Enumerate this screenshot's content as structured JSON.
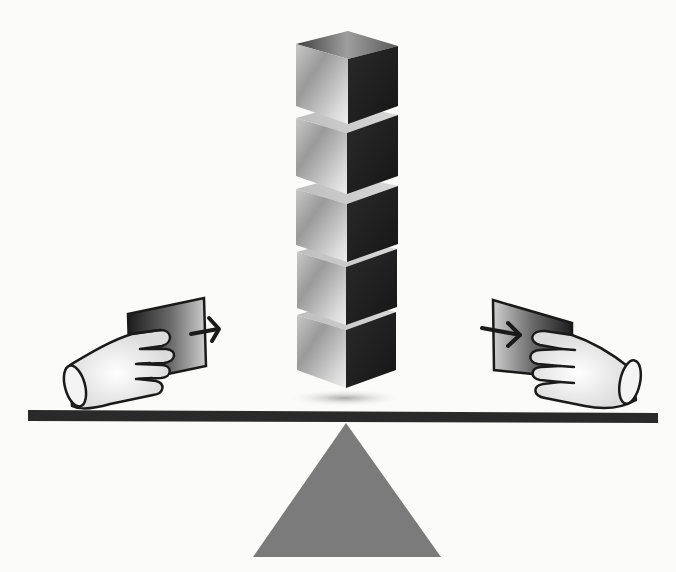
{
  "figure": {
    "title": "Balance scale with stacked cubes and hands exchanging cards",
    "cubes": {
      "count": 5,
      "colors": {
        "light": "#e6e6e6",
        "mid": "#8c8c8c",
        "dark": "#1e1e1e"
      }
    },
    "beam": {
      "color": "#2a2a2a"
    },
    "fulcrum": {
      "shape": "triangle",
      "color": "#7b7b7b"
    },
    "left_hand": {
      "action": "pushing card",
      "arrow_direction": "right"
    },
    "right_hand": {
      "action": "receiving card",
      "arrow_direction": "right"
    },
    "background_color": "#fbfbfa"
  }
}
